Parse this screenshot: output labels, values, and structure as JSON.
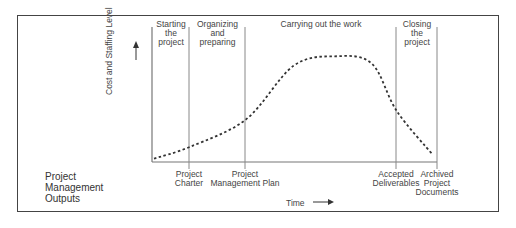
{
  "diagram": {
    "y_axis_label": "Cost and Staffing Level",
    "x_axis_label": "Time",
    "phases": [
      {
        "label_lines": [
          "Starting",
          "the",
          "project"
        ]
      },
      {
        "label_lines": [
          "Organizing",
          "and",
          "preparing"
        ]
      },
      {
        "label_lines": [
          "Carrying out the work"
        ]
      },
      {
        "label_lines": [
          "Closing",
          "the",
          "project"
        ]
      }
    ],
    "outputs_title_lines": [
      "Project",
      "Management",
      "Outputs"
    ],
    "outputs": [
      {
        "label_lines": [
          "Project",
          "Charter"
        ]
      },
      {
        "label_lines": [
          "Project",
          "Management Plan"
        ]
      },
      {
        "label_lines": [
          "Accepted",
          "Deliverables"
        ]
      },
      {
        "label_lines": [
          "Archived",
          "Project",
          "Documents"
        ]
      }
    ],
    "curve": {
      "style": "dashed",
      "description": "Cost and staffing level: low at start, rises through organizing, peaks and plateaus during execution, drops sharply during closing",
      "relative_levels": [
        {
          "t": 0.0,
          "level": 0.02
        },
        {
          "t": 0.13,
          "level": 0.12
        },
        {
          "t": 0.33,
          "level": 0.35
        },
        {
          "t": 0.5,
          "level": 0.8
        },
        {
          "t": 0.65,
          "level": 0.88
        },
        {
          "t": 0.78,
          "level": 0.82
        },
        {
          "t": 0.87,
          "level": 0.42
        },
        {
          "t": 1.0,
          "level": 0.05
        }
      ]
    }
  }
}
